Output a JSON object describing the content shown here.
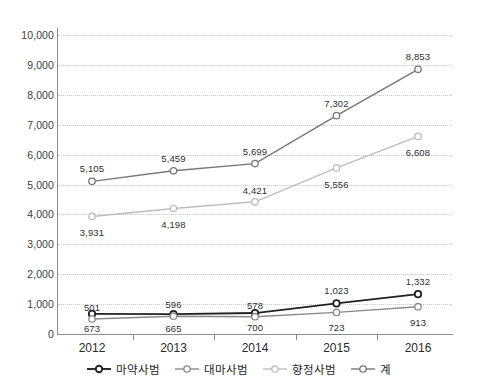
{
  "chart_data": {
    "type": "line",
    "title": "",
    "xlabel": "",
    "ylabel": "",
    "categories": [
      "2012",
      "2013",
      "2014",
      "2015",
      "2016"
    ],
    "ylim": [
      0,
      10000
    ],
    "ytick_step": 1000,
    "ytick_labels": [
      "10,000",
      "9,000",
      "8,000",
      "7,000",
      "6,000",
      "5,000",
      "4,000",
      "3,000",
      "2,000",
      "1,000",
      "0"
    ],
    "ytick_values": [
      10000,
      9000,
      8000,
      7000,
      6000,
      5000,
      4000,
      3000,
      2000,
      1000,
      0
    ],
    "grid": true,
    "legend_position": "bottom",
    "series": [
      {
        "name": "마약사범",
        "color": "#222222",
        "marker": "open-circle",
        "values": [
          673,
          665,
          700,
          1023,
          1332
        ],
        "labels": [
          "673",
          "665",
          "700",
          "1,023",
          "1,332"
        ]
      },
      {
        "name": "대마사범",
        "color": "#8a8a8a",
        "marker": "open-circle",
        "values": [
          501,
          596,
          578,
          723,
          913
        ],
        "labels": [
          "501",
          "596",
          "578",
          "723",
          "913"
        ]
      },
      {
        "name": "향정사범",
        "color": "#bdbdbd",
        "marker": "open-circle",
        "values": [
          3931,
          4198,
          4421,
          5556,
          6608
        ],
        "labels": [
          "3,931",
          "4,198",
          "4,421",
          "5,556",
          "6,608"
        ]
      },
      {
        "name": "계",
        "color": "#777777",
        "marker": "open-circle",
        "values": [
          5105,
          5459,
          5699,
          7302,
          8853
        ],
        "labels": [
          "5,105",
          "5,459",
          "5,699",
          "7,302",
          "8,853"
        ]
      }
    ]
  },
  "legend": {
    "items": [
      {
        "label": "마약사범",
        "color": "#222222"
      },
      {
        "label": "대마사범",
        "color": "#8a8a8a"
      },
      {
        "label": "향정사범",
        "color": "#bdbdbd"
      },
      {
        "label": "계",
        "color": "#777777"
      }
    ]
  },
  "axis": {
    "x_labels": [
      "2012",
      "2013",
      "2014",
      "2015",
      "2016"
    ],
    "y_labels": [
      "10,000",
      "9,000",
      "8,000",
      "7,000",
      "6,000",
      "5,000",
      "4,000",
      "3,000",
      "2,000",
      "1,000",
      "0"
    ]
  }
}
